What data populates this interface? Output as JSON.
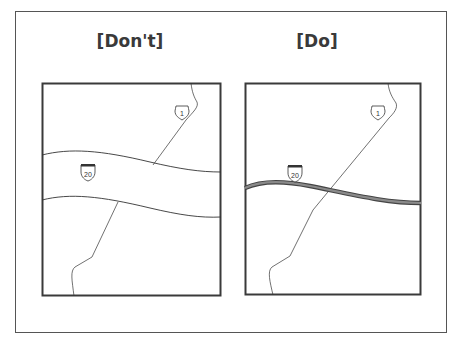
{
  "panels": [
    {
      "title": "[Don't]",
      "shields": {
        "interstate": "20",
        "us_route": "1"
      },
      "style": "wide double-line highway band"
    },
    {
      "title": "[Do]",
      "shields": {
        "interstate": "20",
        "us_route": "1"
      },
      "style": "narrow thick gray highway line"
    }
  ],
  "colors": {
    "frame": "#3a3a3a",
    "road_line": "#333333",
    "highway_fill": "#7a7a7a",
    "highway_edge": "#444444"
  }
}
